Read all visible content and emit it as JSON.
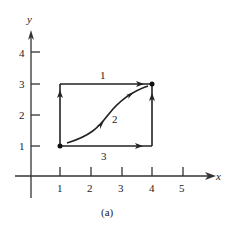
{
  "figure": {
    "caption": "(a)",
    "axes": {
      "x_label": "x",
      "y_label": "y",
      "x_ticks": [
        "1",
        "2",
        "3",
        "4",
        "5"
      ],
      "y_ticks": [
        "1",
        "2",
        "3",
        "4"
      ]
    },
    "points": [
      {
        "name": "start",
        "x": 1,
        "y": 1
      },
      {
        "name": "end",
        "x": 4,
        "y": 3
      }
    ],
    "paths": [
      {
        "label": "1",
        "description": "from (1,1) up to (1,3) then right to (4,3)"
      },
      {
        "label": "2",
        "description": "curved path from (1,1) to (4,3)"
      },
      {
        "label": "3",
        "description": "from (1,1) right to (4,1) then up to (4,3)"
      }
    ],
    "colors": {
      "ink": "#222222",
      "background": "#ffffff"
    }
  }
}
